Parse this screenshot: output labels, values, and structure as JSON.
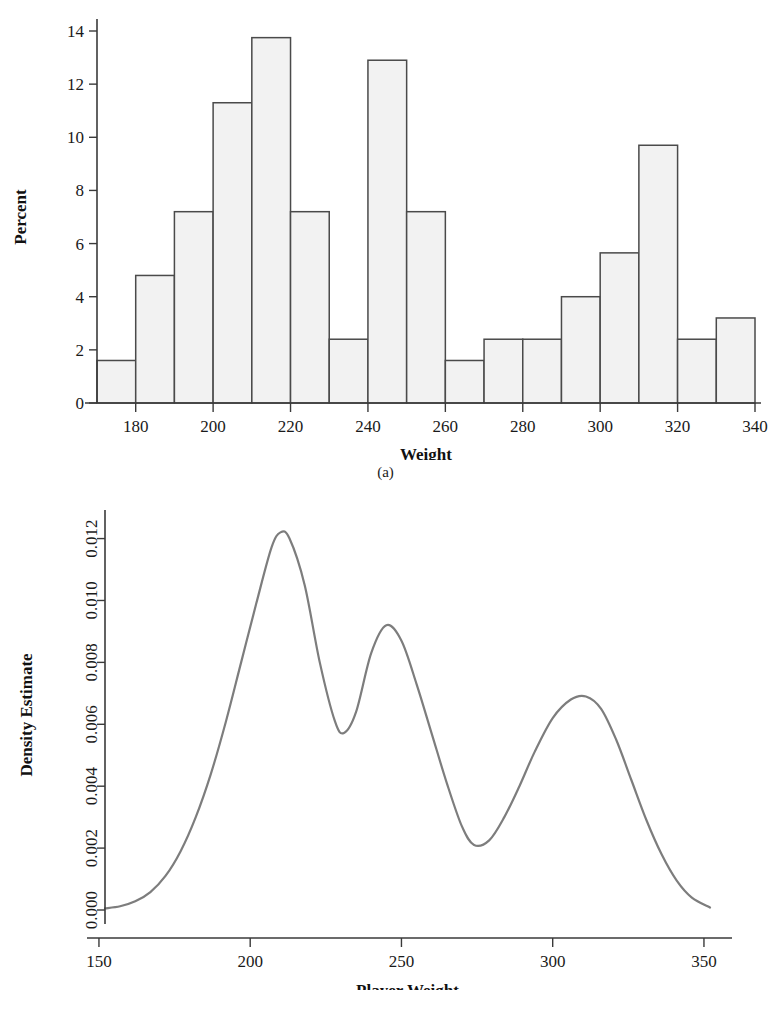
{
  "figure_a": {
    "caption": "(a)",
    "xlabel": "Weight",
    "ylabel": "Percent",
    "xticks": [
      "180",
      "200",
      "220",
      "240",
      "260",
      "280",
      "300",
      "320",
      "340"
    ],
    "yticks": [
      "0",
      "2",
      "4",
      "6",
      "8",
      "10",
      "12",
      "14"
    ]
  },
  "figure_b": {
    "caption": "(b)",
    "xlabel": "Player Weight",
    "ylabel": "Density Estimate",
    "xticks": [
      "150",
      "200",
      "250",
      "300",
      "350"
    ],
    "yticks": [
      "0.000",
      "0.002",
      "0.004",
      "0.006",
      "0.008",
      "0.010",
      "0.012"
    ]
  },
  "colors": {
    "bar_fill": "#f2f2f2",
    "bar_stroke": "#4a4a4a",
    "curve": "#7d7d7d",
    "axis": "#3a3a3a",
    "text": "#1a1a1a",
    "background": "#ffffff"
  },
  "chart_data": [
    {
      "type": "bar",
      "title": "",
      "subtitle": "",
      "xlabel": "Weight",
      "ylabel": "Percent",
      "grid": false,
      "legend": "none",
      "xlim": [
        170,
        340
      ],
      "ylim": [
        0,
        14.5
      ],
      "bin_width": 10,
      "bin_starts": [
        170,
        180,
        190,
        200,
        210,
        220,
        230,
        240,
        250,
        260,
        270,
        280,
        290,
        300,
        310,
        320,
        330
      ],
      "categories": [
        "170-180",
        "180-190",
        "190-200",
        "200-210",
        "210-220",
        "220-230",
        "230-240",
        "240-250",
        "250-260",
        "260-270",
        "270-280",
        "280-290",
        "290-300",
        "300-310",
        "310-320",
        "320-330",
        "330-340"
      ],
      "values": [
        1.6,
        4.8,
        7.2,
        11.3,
        13.75,
        7.2,
        2.4,
        12.9,
        7.2,
        1.6,
        2.4,
        2.4,
        4.0,
        5.65,
        9.7,
        2.4,
        3.2
      ],
      "xticks": [
        180,
        200,
        220,
        240,
        260,
        280,
        300,
        320,
        340
      ],
      "yticks": [
        0,
        2,
        4,
        6,
        8,
        10,
        12,
        14
      ]
    },
    {
      "type": "line",
      "title": "",
      "subtitle": "",
      "xlabel": "Player Weight",
      "ylabel": "Density Estimate",
      "grid": false,
      "legend": "none",
      "xlim": [
        152,
        352
      ],
      "ylim": [
        0.0,
        0.0126
      ],
      "xticks": [
        150,
        200,
        250,
        300,
        350
      ],
      "yticks": [
        0.0,
        0.002,
        0.004,
        0.006,
        0.008,
        0.01,
        0.012
      ],
      "annotations": [
        "mode near 210 (~0.0122)",
        "mode near 245 (~0.0092)",
        "mode near 311 (~0.0069)",
        "trough near 231 (~0.0057)",
        "trough near 274 (~0.0021)"
      ],
      "x": [
        152,
        157,
        162,
        167,
        172,
        177,
        182,
        187,
        192,
        197,
        202,
        207,
        210,
        213,
        218,
        223,
        228,
        231,
        235,
        240,
        245,
        250,
        255,
        260,
        265,
        270,
        274,
        279,
        284,
        289,
        294,
        300,
        306,
        311,
        316,
        321,
        326,
        331,
        336,
        341,
        346,
        352
      ],
      "y": [
        5e-05,
        0.00012,
        0.00028,
        0.00058,
        0.0011,
        0.0019,
        0.003,
        0.0044,
        0.0061,
        0.008,
        0.0099,
        0.0117,
        0.0122,
        0.012,
        0.0105,
        0.008,
        0.0061,
        0.00572,
        0.0064,
        0.0083,
        0.0092,
        0.0087,
        0.0073,
        0.0057,
        0.0041,
        0.0027,
        0.0021,
        0.00225,
        0.003,
        0.004,
        0.0051,
        0.0062,
        0.0068,
        0.0069,
        0.0065,
        0.0055,
        0.0042,
        0.0029,
        0.0018,
        0.00095,
        0.0004,
        8e-05
      ]
    }
  ]
}
